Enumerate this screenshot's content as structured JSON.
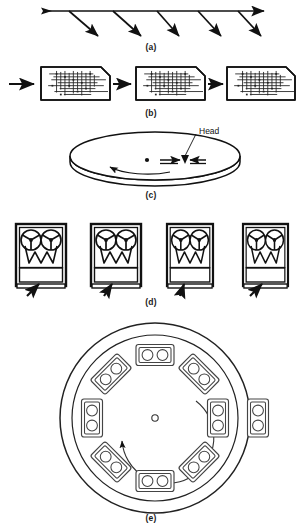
{
  "figure": {
    "background_color": "#ffffff",
    "ink_color": "#111111",
    "width": 302,
    "height": 532
  },
  "captions": {
    "a": "(a)",
    "b": "(b)",
    "c": "(c)",
    "d": "(d)",
    "e": "(e)"
  },
  "panels": [
    {
      "id": "a",
      "name": "branching-arrow-timeline",
      "caption": "(a)",
      "description": "Horizontal arrow with five diagonal branch arrows pointing down-right",
      "main_arrow": {
        "x1": 40,
        "y1": 10,
        "x2": 267,
        "y2": 10,
        "double_headed": true
      },
      "branch_count": 5,
      "branch_arrows": [
        {
          "x1": 68,
          "y1": 10,
          "x2": 100,
          "y2": 38
        },
        {
          "x1": 112,
          "y1": 10,
          "x2": 144,
          "y2": 38
        },
        {
          "x1": 156,
          "y1": 10,
          "x2": 182,
          "y2": 38
        },
        {
          "x1": 196,
          "y1": 10,
          "x2": 224,
          "y2": 38
        },
        {
          "x1": 236,
          "y1": 10,
          "x2": 264,
          "y2": 38
        }
      ]
    },
    {
      "id": "b",
      "name": "chip-die-sequence",
      "caption": "(b)",
      "description": "Three integrated-circuit chips with beveled top-right corner connected by right-pointing arrows",
      "chip_count": 3,
      "arrow_count": 3,
      "chips": [
        {
          "x": 41,
          "y": 66,
          "w": 69,
          "h": 33,
          "bevel": 9
        },
        {
          "x": 136,
          "y": 66,
          "w": 69,
          "h": 33,
          "bevel": 9
        },
        {
          "x": 226,
          "y": 66,
          "w": 69,
          "h": 33,
          "bevel": 9
        }
      ],
      "arrows": [
        {
          "x1": 10,
          "y1": 84,
          "x2": 36,
          "y2": 84
        },
        {
          "x1": 112,
          "y1": 84,
          "x2": 132,
          "y2": 84
        },
        {
          "x1": 207,
          "y1": 84,
          "x2": 223,
          "y2": 84
        }
      ]
    },
    {
      "id": "c",
      "name": "disk-platter",
      "caption": "(c)",
      "description": "Rotating disk platter shown in perspective with a read/write head and spin-direction arrow",
      "label": "Head",
      "platter": {
        "cx": 155,
        "cy": 156,
        "rx": 85,
        "ry": 24,
        "thickness": 6
      },
      "spindle": {
        "cx": 147,
        "cy": 160,
        "r": 2
      },
      "head_marker": {
        "x": 186,
        "y": 160
      },
      "leader_line": {
        "x1": 196,
        "y1": 131,
        "x2": 184,
        "y2": 161
      },
      "rotation_arrow": "counter-clockwise"
    },
    {
      "id": "d",
      "name": "tape-drive-bank",
      "caption": "(d)",
      "description": "Bank of four reel-to-reel magnetic tape drive cabinets, each with two supply reels, a zig-zag tape path and a control panel; an arrow points up at each unit",
      "drive_count": 4,
      "reels_per_drive": 2,
      "reel_spokes": 3,
      "drives": [
        {
          "x": 16,
          "y": 224,
          "w": 50,
          "h": 62
        },
        {
          "x": 91,
          "y": 224,
          "w": 50,
          "h": 62
        },
        {
          "x": 168,
          "y": 224,
          "w": 45,
          "h": 62
        },
        {
          "x": 243,
          "y": 224,
          "w": 45,
          "h": 62
        }
      ],
      "pointer_arrows": [
        {
          "x1": 29,
          "y1": 296,
          "x2": 39,
          "y2": 283
        },
        {
          "x1": 105,
          "y1": 296,
          "x2": 112,
          "y2": 283
        },
        {
          "x1": 179,
          "y1": 296,
          "x2": 185,
          "y2": 283
        },
        {
          "x1": 252,
          "y1": 296,
          "x2": 262,
          "y2": 283
        }
      ]
    },
    {
      "id": "e",
      "name": "tape-cartridge-carousel",
      "caption": "(e)",
      "description": "Circular robotic tape library carousel holding eight two-reel cartridges arranged radially, with a counter-clockwise rotation arrow and a ninth cartridge waiting outside the carousel",
      "outer_circle": {
        "cx": 155,
        "cy": 418,
        "r": 95
      },
      "inner_circle": {
        "cx": 155,
        "cy": 418,
        "r": 83
      },
      "hub": {
        "cx": 155,
        "cy": 418,
        "r": 3
      },
      "cartridges_in_carousel": 8,
      "cartridges_outside": 1,
      "cartridge_reels": 2,
      "rotation_arrow": "counter-clockwise",
      "external_cartridge": {
        "x": 247,
        "y": 398,
        "w": 22,
        "h": 42
      }
    }
  ]
}
